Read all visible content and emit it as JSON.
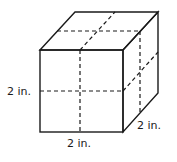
{
  "figure": {
    "type": "cube",
    "labels": {
      "height": "2 in.",
      "width": "2 in.",
      "depth": "2 in."
    },
    "colors": {
      "line": "#1a1a1a",
      "background": "#ffffff"
    }
  }
}
